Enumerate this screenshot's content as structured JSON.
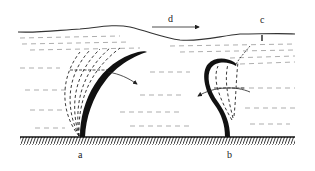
{
  "figure": {
    "type": "diagram",
    "labels": {
      "a": "a",
      "b": "b",
      "c": "c",
      "d": "d"
    },
    "colors": {
      "ink": "#111111",
      "background": "#ffffff",
      "water_lines": "#555555"
    }
  }
}
